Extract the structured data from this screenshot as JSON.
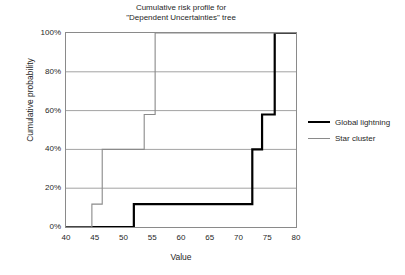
{
  "chart_data": {
    "type": "line",
    "title": "Cumulative risk profile for \"Dependent Uncertainties\" tree",
    "title_line1": "Cumulative risk profile for",
    "title_line2": "\"Dependent Uncertainties\" tree",
    "xlabel": "Value",
    "ylabel": "Cumulative probability",
    "xlim": [
      40,
      80
    ],
    "ylim": [
      0,
      100
    ],
    "xticks": [
      40,
      45,
      50,
      55,
      60,
      65,
      70,
      75,
      80
    ],
    "xtick_labels": [
      "40",
      "45",
      "50",
      "55",
      "60",
      "65",
      "70",
      "75",
      "80"
    ],
    "yticks": [
      0,
      20,
      40,
      60,
      80,
      100
    ],
    "ytick_labels": [
      "0%",
      "20%",
      "40%",
      "60%",
      "80%",
      "100%"
    ],
    "grid": "horizontal",
    "legend_position": "right",
    "series": [
      {
        "name": "Global lightning",
        "color": "#000000",
        "width": 2.2,
        "style": "step-post",
        "x": [
          40,
          51.8,
          51.8,
          72.4,
          72.4,
          74.1,
          74.1,
          76.3,
          76.3,
          80
        ],
        "y": [
          0,
          0,
          11.8,
          11.8,
          40,
          40,
          58,
          58,
          100,
          100
        ]
      },
      {
        "name": "Star cluster",
        "color": "#8a8a8a",
        "width": 1.1,
        "style": "step-post",
        "x": [
          40,
          44.5,
          44.5,
          46.3,
          46.3,
          53.6,
          53.6,
          55.5,
          55.5,
          80
        ],
        "y": [
          0,
          0,
          11.8,
          11.8,
          40,
          40,
          58,
          58,
          100,
          100
        ]
      }
    ]
  },
  "legend": {
    "items": [
      {
        "label": "Global lightning"
      },
      {
        "label": "Star cluster"
      }
    ]
  }
}
